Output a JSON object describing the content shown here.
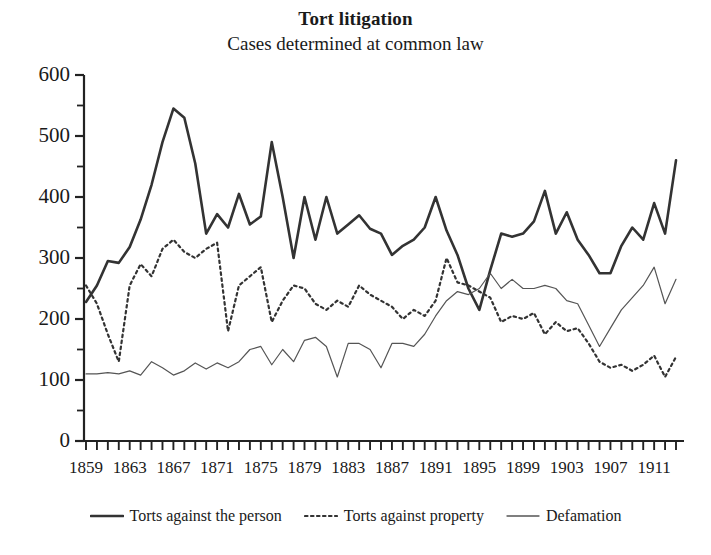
{
  "chart_data": {
    "type": "line",
    "title": "Tort litigation",
    "subtitle": "Cases determined at common law",
    "xlabel": "",
    "ylabel": "",
    "grid": false,
    "legend_position": "bottom",
    "ylim": [
      0,
      600
    ],
    "ytick_step": 100,
    "yminor_step": 50,
    "yticks": [
      0,
      100,
      200,
      300,
      400,
      500,
      600
    ],
    "xlim": [
      1859,
      1913
    ],
    "xtick_step": 1,
    "xlabel_step": 4,
    "xticks": [
      1859,
      1863,
      1867,
      1871,
      1875,
      1879,
      1883,
      1887,
      1891,
      1895,
      1899,
      1903,
      1907,
      1911
    ],
    "x": [
      1859,
      1860,
      1861,
      1862,
      1863,
      1864,
      1865,
      1866,
      1867,
      1868,
      1869,
      1870,
      1871,
      1872,
      1873,
      1874,
      1875,
      1876,
      1877,
      1878,
      1879,
      1880,
      1881,
      1882,
      1883,
      1884,
      1885,
      1886,
      1887,
      1888,
      1889,
      1890,
      1891,
      1892,
      1893,
      1894,
      1895,
      1896,
      1897,
      1898,
      1899,
      1900,
      1901,
      1902,
      1903,
      1904,
      1905,
      1906,
      1907,
      1908,
      1909,
      1910,
      1911,
      1912,
      1913
    ],
    "series": [
      {
        "name": "Torts against the person",
        "style": "solid-thick",
        "color": "#333333",
        "values": [
          228,
          255,
          295,
          292,
          318,
          363,
          420,
          490,
          545,
          530,
          455,
          340,
          372,
          350,
          405,
          355,
          368,
          490,
          400,
          300,
          400,
          330,
          400,
          340,
          355,
          370,
          348,
          340,
          305,
          320,
          330,
          350,
          400,
          345,
          305,
          250,
          215,
          280,
          340,
          335,
          340,
          360,
          410,
          340,
          375,
          330,
          305,
          275,
          275,
          320,
          350,
          330,
          390,
          340,
          460
        ]
      },
      {
        "name": "Torts against property",
        "style": "dotted",
        "color": "#333333",
        "values": [
          255,
          225,
          175,
          130,
          255,
          290,
          270,
          315,
          330,
          310,
          300,
          315,
          325,
          180,
          255,
          270,
          285,
          195,
          230,
          255,
          250,
          225,
          215,
          230,
          220,
          255,
          240,
          230,
          220,
          200,
          215,
          205,
          230,
          300,
          260,
          255,
          245,
          235,
          195,
          205,
          200,
          210,
          175,
          195,
          180,
          185,
          160,
          130,
          120,
          125,
          115,
          125,
          140,
          105,
          138
        ]
      },
      {
        "name": "Defamation",
        "style": "solid-thin",
        "color": "#555555",
        "values": [
          110,
          110,
          112,
          110,
          115,
          108,
          130,
          120,
          108,
          115,
          128,
          118,
          128,
          120,
          130,
          150,
          155,
          125,
          150,
          130,
          165,
          170,
          155,
          105,
          160,
          160,
          150,
          120,
          160,
          160,
          155,
          175,
          205,
          230,
          245,
          240,
          250,
          275,
          250,
          265,
          250,
          250,
          255,
          250,
          230,
          225,
          190,
          155,
          185,
          215,
          235,
          255,
          285,
          225,
          265
        ]
      }
    ]
  },
  "legend": {
    "items": [
      {
        "label": "Torts against the person",
        "style": "solid-thick"
      },
      {
        "label": "Torts against property",
        "style": "dotted"
      },
      {
        "label": "Defamation",
        "style": "solid-thin"
      }
    ]
  }
}
